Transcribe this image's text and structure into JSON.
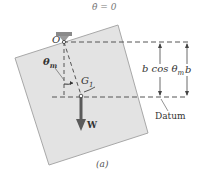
{
  "figure": {
    "caption": "(a)",
    "theta_dot_label": "θ̇ = 0",
    "pivot_label": "O",
    "angle_label": "θm",
    "angle_symbol": "θ",
    "angle_subscript": "m",
    "center_label": "G",
    "center_subscript": "1",
    "weight_label": "W",
    "dimension_b_cos": "b cos θm",
    "dimension_b_cos_main": "b cos θ",
    "dimension_b_cos_sub": "m",
    "dimension_b": "b",
    "datum_label": "Datum"
  },
  "colors": {
    "plate_fill": "#e3e3e3",
    "plate_edge": "#a8a8a8",
    "dashed_line": "#555555",
    "weight_arrow": "#555555",
    "text": "#333333",
    "support": "#888888"
  }
}
